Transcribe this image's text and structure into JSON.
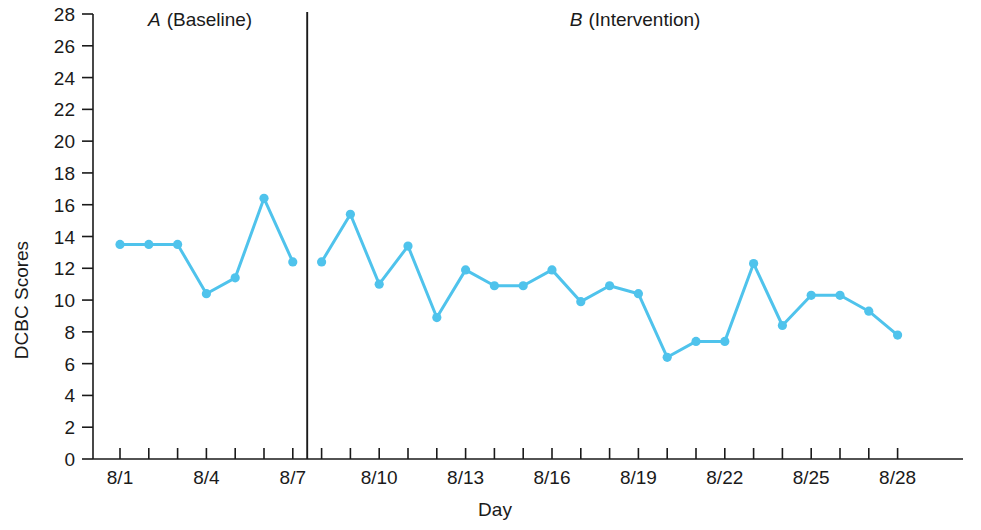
{
  "chart_data": {
    "type": "line",
    "title": "",
    "xlabel": "Day",
    "ylabel": "DCBC Scores",
    "ylim": [
      0,
      28
    ],
    "ytick_step": 2,
    "yticks": [
      0,
      2,
      4,
      6,
      8,
      10,
      12,
      14,
      16,
      18,
      20,
      22,
      24,
      26,
      28
    ],
    "ytick_labels": [
      "0",
      "2",
      "4",
      "6",
      "8",
      "10",
      "12",
      "14",
      "16",
      "18",
      "20",
      "22",
      "24",
      "26",
      "28"
    ],
    "grid": false,
    "legend": "none",
    "x": [
      "8/1",
      "8/2",
      "8/3",
      "8/4",
      "8/5",
      "8/6",
      "8/7",
      "8/8",
      "8/9",
      "8/10",
      "8/11",
      "8/12",
      "8/13",
      "8/14",
      "8/15",
      "8/16",
      "8/17",
      "8/18",
      "8/19",
      "8/20",
      "8/21",
      "8/22",
      "8/23",
      "8/24",
      "8/25",
      "8/26",
      "8/27",
      "8/28"
    ],
    "xtick_labels_shown": [
      "8/1",
      "8/4",
      "8/7",
      "8/10",
      "8/13",
      "8/16",
      "8/19",
      "8/22",
      "8/25",
      "8/28"
    ],
    "xtick_label_indices": [
      0,
      3,
      6,
      9,
      12,
      15,
      18,
      21,
      24,
      27
    ],
    "values": [
      13.5,
      13.5,
      13.5,
      10.4,
      11.4,
      16.4,
      12.4,
      12.4,
      15.4,
      11.0,
      13.4,
      8.9,
      11.9,
      10.9,
      10.9,
      11.9,
      9.9,
      10.9,
      10.4,
      6.4,
      7.4,
      7.4,
      12.3,
      8.4,
      10.3,
      10.3,
      9.3,
      7.8
    ],
    "series": [
      {
        "name": "DCBC Scores",
        "color": "#4FC3EC",
        "values": [
          13.5,
          13.5,
          13.5,
          10.4,
          11.4,
          16.4,
          12.4,
          12.4,
          15.4,
          11.0,
          13.4,
          8.9,
          11.9,
          10.9,
          10.9,
          11.9,
          9.9,
          10.9,
          10.4,
          6.4,
          7.4,
          7.4,
          12.3,
          8.4,
          10.3,
          10.3,
          9.3,
          7.8
        ]
      }
    ],
    "phases": [
      {
        "key": "A",
        "letter": "A",
        "label": "(Baseline)",
        "start_index": 0,
        "end_index": 6
      },
      {
        "key": "B",
        "letter": "B",
        "label": "(Intervention)",
        "start_index": 7,
        "end_index": 27
      }
    ],
    "phase_divider_after_index": 6,
    "colors": {
      "line": "#4FC3EC",
      "marker": "#4FC3EC",
      "axis": "#1a1a1a",
      "text": "#1a1a1a",
      "background": "#ffffff"
    }
  },
  "axes": {
    "y_title": "DCBC Scores",
    "x_title": "Day"
  },
  "phase_a": {
    "letter": "A",
    "label": "(Baseline)"
  },
  "phase_b": {
    "letter": "B",
    "label": "(Intervention)"
  }
}
